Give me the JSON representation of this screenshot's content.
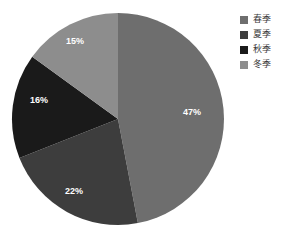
{
  "chart_data": {
    "type": "pie",
    "title": "",
    "categories": [
      "春季",
      "夏季",
      "秋季",
      "冬季"
    ],
    "values": [
      47,
      22,
      16,
      15
    ],
    "value_labels": [
      "47%",
      "22%",
      "16%",
      "15%"
    ],
    "unit": "%",
    "colors": [
      "#6e6e6e",
      "#3d3d3d",
      "#1a1a1a",
      "#8d8d8d"
    ],
    "legend_position": "right",
    "grid": false,
    "start_angle_deg": 0,
    "direction": "clockwise",
    "label_color": "#ffffff"
  },
  "legend": {
    "items": [
      {
        "label": "春季",
        "color": "#6e6e6e"
      },
      {
        "label": "夏季",
        "color": "#3d3d3d"
      },
      {
        "label": "秋季",
        "color": "#1a1a1a"
      },
      {
        "label": "冬季",
        "color": "#8d8d8d"
      }
    ]
  },
  "pie": {
    "center_x": 118,
    "center_y": 119,
    "radius": 106,
    "slices": [
      {
        "name": "春季",
        "value": 47,
        "label": "47%",
        "color": "#6e6e6e",
        "label_x": 192,
        "label_y": 113
      },
      {
        "name": "夏季",
        "value": 22,
        "label": "22%",
        "color": "#3d3d3d",
        "label_x": 74,
        "label_y": 192
      },
      {
        "name": "秋季",
        "value": 16,
        "label": "16%",
        "color": "#1a1a1a",
        "label_x": 39,
        "label_y": 101
      },
      {
        "name": "冬季",
        "value": 15,
        "label": "15%",
        "color": "#8d8d8d",
        "label_x": 75,
        "label_y": 42
      }
    ]
  }
}
